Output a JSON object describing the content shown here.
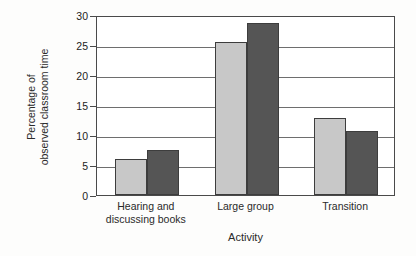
{
  "chart_data": {
    "type": "bar",
    "title": "",
    "xlabel": "Activity",
    "ylabel": "Percentage of observed classroom time",
    "ylabel_lines": [
      "Percentage of",
      "observed classroom time"
    ],
    "categories": [
      "Hearing and discussing books",
      "Large group",
      "Transition"
    ],
    "category_lines": [
      [
        "Hearing and",
        "discussing books"
      ],
      [
        "Large group"
      ],
      [
        "Transition"
      ]
    ],
    "series": [
      {
        "name": "series-1",
        "color": "#c8c8c8",
        "values": [
          6.0,
          25.5,
          12.8
        ]
      },
      {
        "name": "series-2",
        "color": "#555555",
        "values": [
          7.5,
          28.6,
          10.6
        ]
      }
    ],
    "ylim": [
      0,
      30
    ],
    "ytick_values": [
      0,
      5,
      10,
      15,
      20,
      25,
      30
    ],
    "ytick_labels": [
      "0",
      "5",
      "10",
      "15",
      "20",
      "25",
      "30"
    ],
    "grid": "horizontal",
    "legend": "none",
    "axis_color": "#4a4a4a",
    "grid_color": "#6e6e6e",
    "bar_outline_color": "#3d3d3d",
    "plot_background": "#ffffff",
    "page_background": "#fdfdfc"
  }
}
